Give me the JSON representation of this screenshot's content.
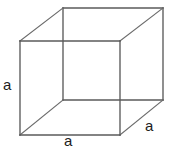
{
  "figure": {
    "type": "cube-diagram",
    "background_color": "#ffffff",
    "stroke_color": "#5a5a5a",
    "text_color": "#1d1d1d",
    "width": 172,
    "height": 149
  },
  "labels": {
    "left_edge": "a",
    "bottom_edge": "a",
    "right_depth_edge": "a"
  },
  "geometry": {
    "front_face": {
      "top_left": [
        20,
        41
      ],
      "top_right": [
        120,
        41
      ],
      "bottom_right": [
        120,
        135
      ],
      "bottom_left": [
        20,
        135
      ]
    },
    "back_face": {
      "top_left": [
        63,
        8
      ],
      "top_right": [
        163,
        8
      ],
      "bottom_right": [
        163,
        100
      ],
      "bottom_left": [
        63,
        100
      ]
    },
    "connectors": [
      [
        [
          20,
          41
        ],
        [
          63,
          8
        ]
      ],
      [
        [
          120,
          41
        ],
        [
          163,
          8
        ]
      ],
      [
        [
          120,
          135
        ],
        [
          163,
          100
        ]
      ],
      [
        [
          20,
          135
        ],
        [
          63,
          100
        ]
      ]
    ]
  }
}
